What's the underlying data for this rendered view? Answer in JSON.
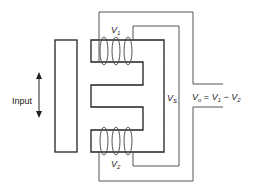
{
  "diagram": {
    "labels": {
      "input": "Input",
      "v1_main": "V",
      "v1_sub": "1",
      "v2_main": "V",
      "v2_sub": "2",
      "vs_main": "V",
      "vs_sub": "S",
      "output_main": "V",
      "output_sub": "o",
      "output_eq": " = ",
      "output_v1": "V",
      "output_v1_sub": "1",
      "output_minus": " − ",
      "output_v2": "V",
      "output_v2_sub": "2"
    },
    "colors": {
      "core": "#222222",
      "wire": "#555555",
      "background": "#ffffff"
    }
  }
}
